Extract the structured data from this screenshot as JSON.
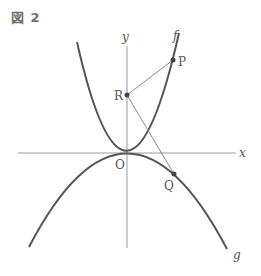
{
  "figure": {
    "title": "図 2"
  },
  "axes": {
    "x_label": "x",
    "y_label": "y",
    "origin_label": "O"
  },
  "curves": {
    "f_label": "f",
    "g_label": "g"
  },
  "points": {
    "P": "P",
    "Q": "Q",
    "R": "R"
  },
  "colors": {
    "curve": "#555555",
    "axis": "#9a9a9a",
    "segment": "#8a8a8a",
    "text": "#555555"
  }
}
